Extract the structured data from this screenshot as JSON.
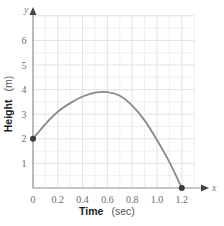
{
  "chart_data": {
    "type": "line",
    "title": "",
    "xlabel": "Time (sec)",
    "xlabel_bold": "Time",
    "xlabel_unit": "(sec)",
    "ylabel": "Height (m)",
    "ylabel_bold": "Height",
    "ylabel_unit": "(m)",
    "x_axis_letter": "x",
    "y_axis_letter": "y",
    "x_ticks": [
      "0",
      "0.2",
      "0.4",
      "0.6",
      "0.8",
      "1.0",
      "1.2"
    ],
    "y_ticks": [
      "1",
      "2",
      "3",
      "4",
      "5",
      "6"
    ],
    "xlim": [
      0,
      1.3
    ],
    "ylim": [
      0,
      7
    ],
    "grid": true,
    "series": [
      {
        "name": "Height",
        "color": "#8a8a8a",
        "x": [
          0,
          0.1,
          0.2,
          0.3,
          0.4,
          0.5,
          0.6,
          0.7,
          0.8,
          0.9,
          1.0,
          1.1,
          1.2
        ],
        "y": [
          2,
          2.6,
          3.1,
          3.45,
          3.72,
          3.88,
          3.9,
          3.75,
          3.35,
          2.75,
          1.95,
          1.05,
          0
        ]
      }
    ],
    "points": [
      {
        "x": 0,
        "y": 2,
        "label": "start"
      },
      {
        "x": 1.2,
        "y": 0,
        "label": "end"
      }
    ]
  }
}
